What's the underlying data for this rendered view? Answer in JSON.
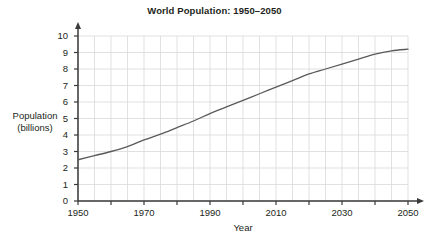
{
  "chart_data": {
    "type": "line",
    "title": "World Population: 1950–2050",
    "xlabel": "Year",
    "ylabel": "Population\n(billions)",
    "ylabel_lines": [
      "Population",
      "(billions)"
    ],
    "xlim": [
      1950,
      2050
    ],
    "ylim": [
      0,
      10
    ],
    "grid": true,
    "grid_x_step": 5,
    "grid_y_step": 1,
    "legend": "none",
    "line_color": "#5a5a5a",
    "grid_color": "#d9d9d9",
    "axis_color": "#3a3a3a",
    "xticks": [
      1950,
      1960,
      1970,
      1980,
      1990,
      2000,
      2010,
      2020,
      2030,
      2040,
      2050
    ],
    "xtick_labels": [
      "1950",
      "",
      "1970",
      "",
      "1990",
      "",
      "2010",
      "",
      "2030",
      "",
      "2050"
    ],
    "xtick_labels_major": [
      "1950",
      "1970",
      "1990",
      "2010",
      "2030",
      "2050"
    ],
    "xticks_major": [
      1950,
      1970,
      1990,
      2010,
      2030,
      2050
    ],
    "yticks": [
      0,
      1,
      2,
      3,
      4,
      5,
      6,
      7,
      8,
      9,
      10
    ],
    "ytick_labels": [
      "0",
      "1",
      "2",
      "3",
      "4",
      "5",
      "6",
      "7",
      "8",
      "9",
      "10"
    ],
    "x": [
      1950,
      1955,
      1960,
      1965,
      1970,
      1975,
      1980,
      1985,
      1990,
      1995,
      2000,
      2005,
      2010,
      2015,
      2020,
      2025,
      2030,
      2035,
      2040,
      2045,
      2050
    ],
    "values": [
      2.5,
      2.75,
      3.0,
      3.3,
      3.7,
      4.05,
      4.45,
      4.85,
      5.3,
      5.7,
      6.1,
      6.5,
      6.9,
      7.3,
      7.7,
      8.0,
      8.3,
      8.6,
      8.9,
      9.1,
      9.2
    ],
    "series": [
      {
        "name": "World population",
        "values": [
          2.5,
          2.75,
          3.0,
          3.3,
          3.7,
          4.05,
          4.45,
          4.85,
          5.3,
          5.7,
          6.1,
          6.5,
          6.9,
          7.3,
          7.7,
          8.0,
          8.3,
          8.6,
          8.9,
          9.1,
          9.2
        ]
      }
    ]
  }
}
